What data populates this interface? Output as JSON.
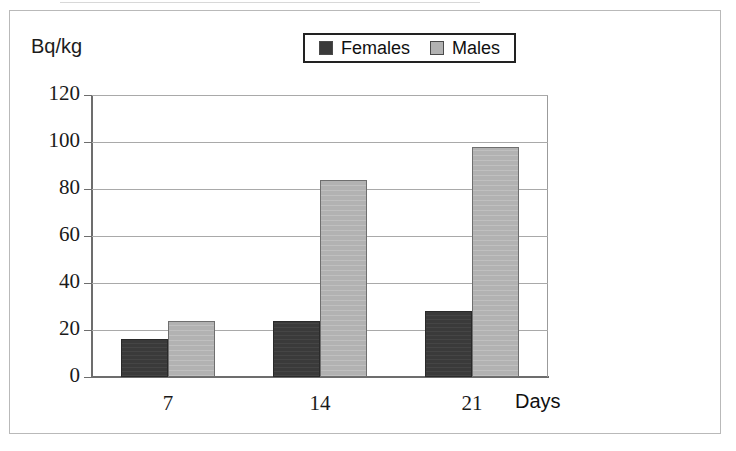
{
  "figure": {
    "y_unit_label": "Bq/kg",
    "x_axis_title": "Days"
  },
  "legend": {
    "entries": [
      {
        "label": "Females",
        "color": "#3a3a3a",
        "icon": "square-swatch-icon"
      },
      {
        "label": "Males",
        "color": "#b2b2b2",
        "icon": "square-swatch-icon"
      }
    ]
  },
  "chart_data": {
    "type": "bar",
    "title": "",
    "xlabel": "Days",
    "ylabel": "Bq/kg",
    "categories": [
      "7",
      "14",
      "21"
    ],
    "series": [
      {
        "name": "Females",
        "color": "#3a3a3a",
        "values": [
          16,
          24,
          28
        ]
      },
      {
        "name": "Males",
        "color": "#b2b2b2",
        "values": [
          24,
          84,
          98
        ]
      }
    ],
    "ylim": [
      0,
      120
    ],
    "ytick_labels": [
      "120",
      "100",
      "80",
      "60",
      "40",
      "20",
      "0"
    ],
    "ytick_values": [
      120,
      100,
      80,
      60,
      40,
      20,
      0
    ],
    "ytick_step": 20,
    "grid": true,
    "grid_axis": "y",
    "legend_position": "top-center"
  }
}
